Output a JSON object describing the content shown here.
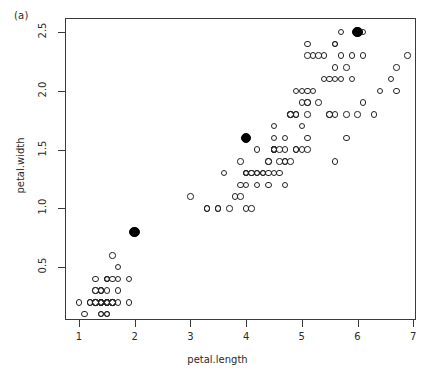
{
  "figure": {
    "panel_label": "(a)",
    "background_color": "#ffffff",
    "frame_color": "#3a3a3a"
  },
  "chart_data": {
    "type": "scatter",
    "title": "",
    "subtitle": "",
    "panel_label": "(a)",
    "xlabel": "petal.length",
    "ylabel": "petal.width",
    "xlim": [
      0.75,
      7.05
    ],
    "ylim": [
      0.05,
      2.62
    ],
    "xticks": [
      1,
      2,
      3,
      4,
      5,
      6,
      7
    ],
    "xticklabels": [
      "1",
      "2",
      "3",
      "4",
      "5",
      "6",
      "7"
    ],
    "yticks": [
      0.5,
      1.0,
      1.5,
      2.0,
      2.5
    ],
    "yticklabels": [
      "0.5",
      "1.0",
      "1.5",
      "2.0",
      "2.5"
    ],
    "grid": false,
    "legend": null,
    "marker_open_color": "#242424",
    "marker_filled_color": "#000000",
    "series": [
      {
        "name": "observations",
        "marker": "open-circle",
        "x": [
          1.4,
          1.4,
          1.3,
          1.5,
          1.4,
          1.7,
          1.4,
          1.5,
          1.4,
          1.5,
          1.5,
          1.6,
          1.4,
          1.1,
          1.2,
          1.5,
          1.3,
          1.4,
          1.7,
          1.5,
          1.7,
          1.5,
          1.0,
          1.7,
          1.9,
          1.6,
          1.6,
          1.5,
          1.4,
          1.6,
          1.6,
          1.5,
          1.5,
          1.4,
          1.5,
          1.2,
          1.3,
          1.4,
          1.3,
          1.5,
          1.3,
          1.3,
          1.3,
          1.6,
          1.9,
          1.4,
          1.6,
          1.4,
          1.5,
          1.4,
          4.7,
          4.5,
          4.9,
          4.0,
          4.6,
          4.5,
          4.7,
          3.3,
          4.6,
          3.9,
          3.5,
          4.2,
          4.0,
          4.7,
          3.6,
          4.4,
          4.5,
          4.1,
          4.5,
          3.9,
          4.8,
          4.0,
          4.9,
          4.7,
          4.3,
          4.4,
          4.8,
          5.0,
          4.5,
          3.5,
          3.8,
          3.7,
          3.9,
          5.1,
          4.5,
          4.5,
          4.7,
          4.4,
          4.1,
          4.0,
          4.4,
          4.6,
          4.0,
          3.3,
          4.2,
          4.2,
          4.2,
          4.3,
          3.0,
          4.1,
          6.0,
          5.1,
          5.9,
          5.6,
          5.8,
          6.6,
          4.5,
          6.3,
          5.8,
          6.1,
          5.1,
          5.3,
          5.5,
          5.0,
          5.1,
          5.3,
          5.5,
          6.7,
          6.9,
          5.0,
          5.7,
          4.9,
          6.7,
          4.9,
          5.7,
          6.0,
          4.8,
          4.9,
          5.6,
          5.8,
          6.1,
          6.4,
          5.6,
          5.1,
          5.6,
          6.1,
          5.6,
          5.5,
          4.8,
          5.4,
          5.6,
          5.1,
          5.1,
          5.9,
          5.7,
          5.2,
          5.0,
          5.2,
          5.4,
          5.1
        ],
        "y": [
          0.2,
          0.2,
          0.2,
          0.2,
          0.2,
          0.4,
          0.3,
          0.2,
          0.2,
          0.1,
          0.2,
          0.2,
          0.1,
          0.1,
          0.2,
          0.4,
          0.4,
          0.3,
          0.3,
          0.3,
          0.2,
          0.4,
          0.2,
          0.5,
          0.2,
          0.2,
          0.4,
          0.2,
          0.2,
          0.2,
          0.2,
          0.4,
          0.1,
          0.2,
          0.2,
          0.2,
          0.2,
          0.1,
          0.2,
          0.2,
          0.3,
          0.3,
          0.2,
          0.6,
          0.4,
          0.3,
          0.2,
          0.2,
          0.2,
          0.2,
          1.4,
          1.5,
          1.5,
          1.3,
          1.5,
          1.3,
          1.6,
          1.0,
          1.3,
          1.4,
          1.0,
          1.5,
          1.0,
          1.4,
          1.3,
          1.4,
          1.5,
          1.0,
          1.5,
          1.1,
          1.8,
          1.3,
          1.5,
          1.2,
          1.3,
          1.4,
          1.4,
          1.7,
          1.5,
          1.0,
          1.1,
          1.0,
          1.2,
          1.6,
          1.5,
          1.6,
          1.5,
          1.3,
          1.3,
          1.3,
          1.2,
          1.4,
          1.2,
          1.0,
          1.3,
          1.2,
          1.3,
          1.3,
          1.1,
          1.3,
          2.5,
          1.9,
          2.1,
          1.8,
          2.2,
          2.1,
          1.7,
          1.8,
          1.8,
          2.5,
          2.0,
          1.9,
          2.1,
          2.0,
          2.4,
          2.3,
          1.8,
          2.2,
          2.3,
          1.5,
          2.3,
          2.0,
          2.0,
          1.8,
          2.1,
          1.8,
          1.8,
          1.8,
          2.1,
          1.6,
          1.9,
          2.0,
          2.2,
          1.5,
          1.4,
          2.3,
          2.4,
          1.8,
          1.8,
          2.1,
          2.4,
          2.3,
          1.9,
          2.3,
          2.5,
          2.3,
          1.9,
          2.0,
          2.3,
          1.8
        ]
      },
      {
        "name": "cluster-centers",
        "marker": "filled-circle",
        "x": [
          2.0,
          4.0,
          6.0
        ],
        "y": [
          0.8,
          1.6,
          2.5
        ]
      }
    ]
  }
}
